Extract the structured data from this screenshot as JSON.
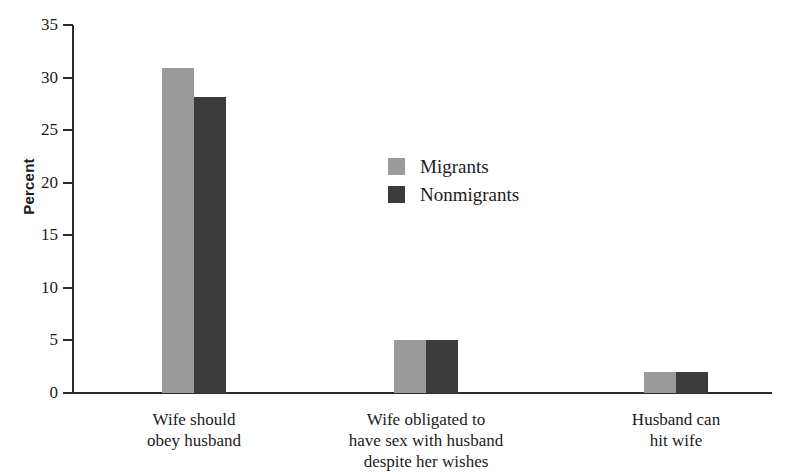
{
  "chart_data": {
    "type": "bar",
    "title": "",
    "xlabel": "",
    "ylabel": "Percent",
    "ylim": [
      0,
      35
    ],
    "yticks": [
      0,
      5,
      10,
      15,
      20,
      25,
      30,
      35
    ],
    "grid": false,
    "legend_position": "center-upper",
    "categories": [
      "Wife should obey husband",
      "Wife obligated to have sex with husband despite her wishes",
      "Husband can hit wife"
    ],
    "category_lines": [
      [
        "Wife should",
        "obey husband"
      ],
      [
        "Wife obligated to",
        "have sex with husband",
        "despite her wishes"
      ],
      [
        "Husband can",
        "hit wife"
      ]
    ],
    "series": [
      {
        "name": "Migrants",
        "color": "#9b9b9b",
        "values": [
          30.9,
          5.0,
          2.0
        ]
      },
      {
        "name": "Nonmigrants",
        "color": "#3c3c3c",
        "values": [
          28.2,
          5.0,
          2.0
        ]
      }
    ]
  },
  "axis": {
    "y_title": "Percent",
    "tick_labels": [
      "35",
      "30",
      "25",
      "20",
      "15",
      "10",
      "5",
      "0"
    ]
  },
  "legend": {
    "items": [
      {
        "label": "Migrants",
        "swatch_name": "legend-swatch-migrants"
      },
      {
        "label": "Nonmigrants",
        "swatch_name": "legend-swatch-nonmigrants"
      }
    ]
  },
  "colors": {
    "migrants": "#9b9b9b",
    "nonmigrants": "#3c3c3c",
    "axis": "#2c2c2c",
    "text": "#1b1b1b",
    "background": "#ffffff"
  }
}
